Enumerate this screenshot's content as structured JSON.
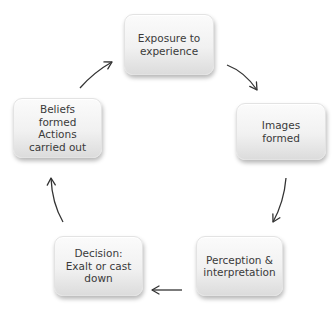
{
  "diagram": {
    "type": "cycle",
    "nodes": [
      {
        "id": "exposure",
        "label": "Exposure to\nexperience"
      },
      {
        "id": "images",
        "label": "Images\nformed"
      },
      {
        "id": "perception",
        "label": "Perception &\ninterpretation"
      },
      {
        "id": "decision",
        "label": "Decision:\nExalt or cast\ndown"
      },
      {
        "id": "beliefs",
        "label": "Beliefs\nformed\nActions\ncarried out"
      }
    ],
    "edges": [
      {
        "from": "exposure",
        "to": "images"
      },
      {
        "from": "images",
        "to": "perception"
      },
      {
        "from": "perception",
        "to": "decision"
      },
      {
        "from": "decision",
        "to": "beliefs"
      },
      {
        "from": "beliefs",
        "to": "exposure"
      }
    ]
  }
}
